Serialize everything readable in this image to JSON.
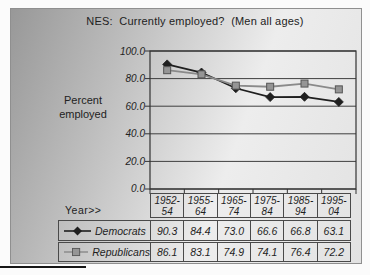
{
  "chart_data": {
    "type": "line",
    "title": "NES:  Currently employed?  (Men all ages)",
    "ylabel": "Percent employed",
    "ylabel_lines": [
      "Percent",
      "employed"
    ],
    "xlabel": "Year>>",
    "categories": [
      "1952-54",
      "1955-64",
      "1965-74",
      "1975-84",
      "1985-94",
      "1995-04"
    ],
    "series": [
      {
        "name": "Democrats",
        "marker": "diamond",
        "color": "#1f1f1f",
        "marker_edge": "#1f1f1f",
        "values": [
          90.3,
          84.4,
          73.0,
          66.6,
          66.8,
          63.1
        ]
      },
      {
        "name": "Republicans",
        "marker": "square",
        "color": "#8a8a8a",
        "marker_fill": "#959595",
        "marker_edge": "#555555",
        "values": [
          86.1,
          83.1,
          74.9,
          74.1,
          76.4,
          72.2
        ]
      }
    ],
    "ylim": [
      0,
      100
    ],
    "yticks": [
      100,
      80,
      60,
      40,
      20,
      0
    ],
    "grid": true,
    "grid_color": "#3f3f3f",
    "frame_color": "#333333",
    "legend_position": "data-table-left",
    "background": "gray-gradient"
  }
}
